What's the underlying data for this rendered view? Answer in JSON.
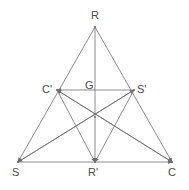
{
  "figure": {
    "kind": "geometry-diagram",
    "background_color": "#ffffff",
    "stroke_color": "#6e6e6e",
    "label_color": "#4a4a4a",
    "stroke_width": 0.8,
    "width": 189,
    "height": 190
  },
  "points": {
    "R": {
      "label": "R",
      "x": 95,
      "y": 27,
      "label_x": 91,
      "label_y": 10
    },
    "S": {
      "label": "S",
      "x": 18,
      "y": 162,
      "label_x": 12,
      "label_y": 167
    },
    "C": {
      "label": "C",
      "x": 172,
      "y": 162,
      "label_x": 168,
      "label_y": 167
    },
    "Cprime": {
      "label": "C'",
      "x": 57,
      "y": 90,
      "label_x": 42,
      "label_y": 84
    },
    "Sprime": {
      "label": "S'",
      "x": 134,
      "y": 90,
      "label_x": 137,
      "label_y": 84
    },
    "Rprime": {
      "label": "R'",
      "x": 95,
      "y": 162,
      "label_x": 88,
      "label_y": 167
    },
    "G": {
      "label": "G",
      "x": 95,
      "y": 117,
      "label_x": 85,
      "label_y": 80
    }
  },
  "segments": [
    {
      "name": "side-R-S",
      "from": "R",
      "to": "S",
      "arrow": "end"
    },
    {
      "name": "side-R-C",
      "from": "R",
      "to": "C",
      "arrow": "end"
    },
    {
      "name": "side-S-C",
      "from": "S",
      "to": "C",
      "arrow": "end"
    },
    {
      "name": "midline-Cp-Sp",
      "from": "Sprime",
      "to": "Cprime",
      "arrow": "end"
    },
    {
      "name": "median-R-Rp",
      "from": "R",
      "to": "Rprime",
      "arrow": "end"
    },
    {
      "name": "median-S-Sp",
      "from": "S",
      "to": "Sprime",
      "arrow": "end"
    },
    {
      "name": "median-C-Cp",
      "from": "C",
      "to": "Cprime",
      "arrow": "end"
    },
    {
      "name": "cevian-Cp-Rp",
      "from": "Cprime",
      "to": "Rprime",
      "arrow": "end"
    },
    {
      "name": "cevian-Sp-Rp",
      "from": "Sprime",
      "to": "Rprime",
      "arrow": "end"
    },
    {
      "name": "cevian-Cp-C",
      "from": "Cprime",
      "to": "C",
      "arrow": "end"
    },
    {
      "name": "cevian-Sp-S",
      "from": "Sprime",
      "to": "S",
      "arrow": "end"
    }
  ]
}
